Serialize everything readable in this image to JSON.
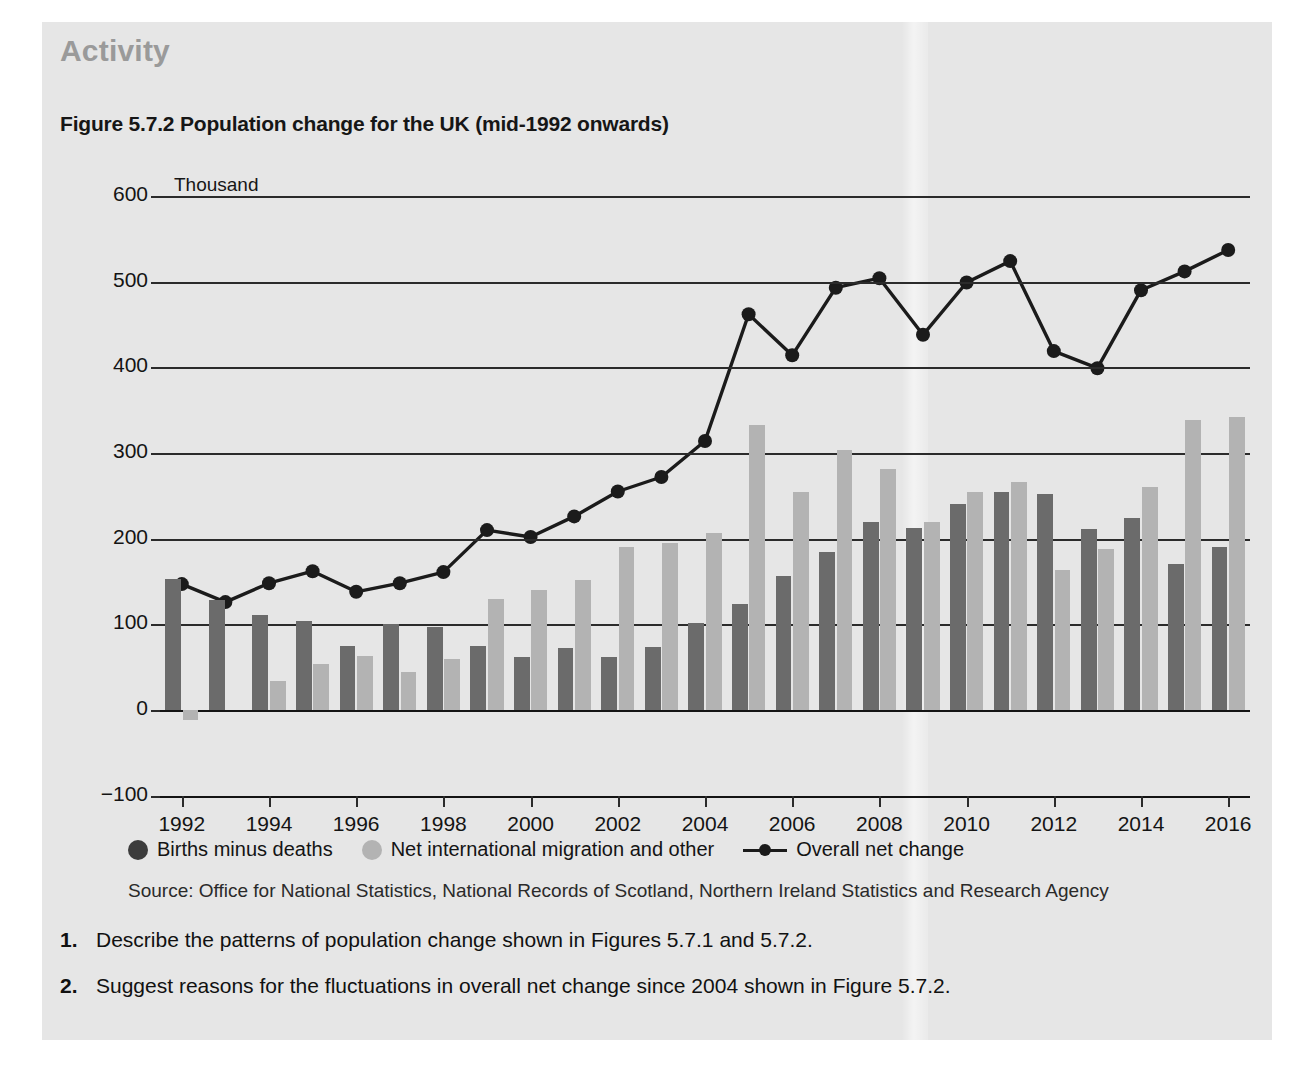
{
  "panel": {
    "activity_title": "Activity",
    "figure_title": "Figure 5.7.2 Population change for the UK (mid-1992 onwards)"
  },
  "legend": {
    "series1": "Births minus deaths",
    "series2": "Net international migration and other",
    "series3": "Overall net change"
  },
  "source": "Source: Office for National Statistics, National Records of Scotland, Northern Ireland Statistics and Research Agency",
  "questions": [
    {
      "number": "1.",
      "text": "Describe the patterns of population change shown in Figures 5.7.1 and 5.7.2."
    },
    {
      "number": "2.",
      "text": "Suggest reasons for the fluctuations in overall net change since 2004 shown in Figure 5.7.2."
    }
  ],
  "colors": {
    "panel_background": "#e6e6e6",
    "births_minus_deaths": "#6b6b6b",
    "net_migration": "#b3b3b3",
    "overall_net_change": "#1b1b1b",
    "activity_title": "#9a9a9a"
  },
  "chart_data": {
    "type": "bar",
    "title": "Figure 5.7.2 Population change for the UK (mid-1992 onwards)",
    "unit_label": "Thousand",
    "xlabel": "",
    "ylabel": "Thousand",
    "ylim": [
      -100,
      600
    ],
    "yticks": [
      -100,
      0,
      100,
      200,
      300,
      400,
      500,
      600
    ],
    "grid": true,
    "legend_position": "bottom",
    "categories": [
      1992,
      1993,
      1994,
      1995,
      1996,
      1997,
      1998,
      1999,
      2000,
      2001,
      2002,
      2003,
      2004,
      2005,
      2006,
      2007,
      2008,
      2009,
      2010,
      2011,
      2012,
      2013,
      2014,
      2015,
      2016
    ],
    "xtick_labels": [
      "1992",
      "1994",
      "1996",
      "1998",
      "2000",
      "2002",
      "2004",
      "2006",
      "2008",
      "2010",
      "2012",
      "2014",
      "2016"
    ],
    "series": [
      {
        "name": "Births minus deaths",
        "type": "bar",
        "color": "#6b6b6b",
        "values": [
          153,
          128,
          111,
          104,
          75,
          100,
          97,
          75,
          62,
          72,
          62,
          74,
          101,
          124,
          157,
          185,
          219,
          213,
          241,
          254,
          252,
          211,
          224,
          170,
          190
        ]
      },
      {
        "name": "Net international migration and other",
        "type": "bar",
        "color": "#b3b3b3",
        "values": [
          -12,
          0,
          34,
          54,
          63,
          44,
          59,
          130,
          140,
          152,
          190,
          195,
          207,
          333,
          254,
          303,
          281,
          220,
          255,
          266,
          164,
          188,
          260,
          338,
          342
        ]
      },
      {
        "name": "Overall net change",
        "type": "line",
        "color": "#1b1b1b",
        "values": [
          147,
          126,
          148,
          162,
          138,
          148,
          161,
          210,
          202,
          226,
          255,
          272,
          314,
          462,
          414,
          493,
          504,
          438,
          499,
          524,
          419,
          399,
          490,
          512,
          537
        ]
      }
    ]
  }
}
